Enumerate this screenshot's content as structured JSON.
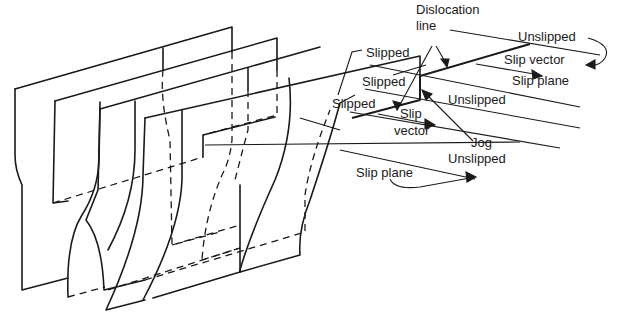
{
  "diagram": {
    "labels": {
      "dislocation_line": [
        "Dislocation",
        "line"
      ],
      "unslipped_top": "Unslipped",
      "slip_vector_top": "Slip vector",
      "slip_plane_top": "Slip plane",
      "slipped_1": "Slipped",
      "slipped_2": "Slipped",
      "slipped_3": "Slipped",
      "unslipped_mid": "Unslipped",
      "slip_vector_mid": [
        "Slip",
        "vector"
      ],
      "jog": "Jog",
      "unslipped_low": "Unslipped",
      "slip_plane_low": "Slip plane"
    },
    "colors": {
      "line": "#1a1a1a",
      "background": "#ffffff"
    }
  }
}
